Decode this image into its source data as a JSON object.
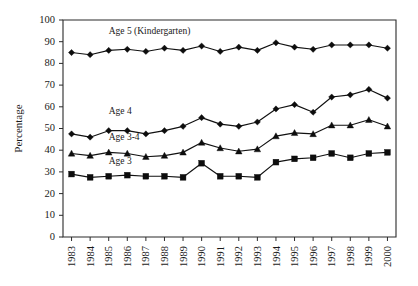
{
  "chart_data": {
    "type": "line",
    "title": "",
    "xlabel": "",
    "ylabel": "Percentage",
    "ylim": [
      0,
      100
    ],
    "ytick_step": 10,
    "yticks": [
      0,
      10,
      20,
      30,
      40,
      50,
      60,
      70,
      80,
      90,
      100
    ],
    "grid": false,
    "legend_position": "inline-annotations",
    "categories": [
      "1983",
      "1984",
      "1985",
      "1986",
      "1987",
      "1988",
      "1989",
      "1990",
      "1991",
      "1992",
      "1993",
      "1994",
      "1995",
      "1996",
      "1997",
      "1998",
      "1999",
      "2000"
    ],
    "series": [
      {
        "name": "Age 5 (Kindergarten)",
        "marker": "diamond",
        "color": "#0d0d0d",
        "values": [
          85,
          84,
          86,
          86.5,
          85.5,
          87,
          86,
          88,
          85.5,
          87.5,
          86,
          89.5,
          87.5,
          86.5,
          88.5,
          88.5,
          88.5,
          87
        ]
      },
      {
        "name": "Age 4",
        "marker": "diamond",
        "color": "#0d0d0d",
        "values": [
          47.5,
          46,
          49,
          49,
          47.5,
          49,
          51,
          55,
          52,
          51,
          53,
          59,
          61,
          57.5,
          64.5,
          65.5,
          68,
          64
        ]
      },
      {
        "name": "Age 3-4",
        "marker": "triangle",
        "color": "#0d0d0d",
        "values": [
          38.5,
          37.5,
          39,
          38.5,
          37,
          37.5,
          39,
          43.5,
          41,
          39.5,
          40.5,
          46.5,
          48,
          47.5,
          51.5,
          51.5,
          54,
          51
        ]
      },
      {
        "name": "Age 3",
        "marker": "square",
        "color": "#0d0d0d",
        "values": [
          29,
          27.5,
          28,
          28.5,
          28,
          28,
          27.5,
          34,
          28,
          28,
          27.5,
          34.5,
          36,
          36.5,
          38.5,
          36.5,
          38.5,
          39
        ]
      }
    ],
    "annotations": [
      {
        "text": "Age 5 (Kindergarten)",
        "x_category": "1985",
        "y_value": 93.5
      },
      {
        "text": "Age 4",
        "x_category": "1985",
        "y_value": 56.5
      },
      {
        "text": "Age 3-4",
        "x_category": "1985",
        "y_value": 44.5
      },
      {
        "text": "Age 3",
        "x_category": "1985",
        "y_value": 33.5
      }
    ]
  }
}
